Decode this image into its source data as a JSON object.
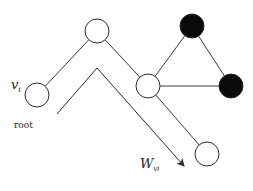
{
  "diagram": {
    "type": "graph-random-walk",
    "labels": {
      "start_node": "v",
      "start_node_sub": "i",
      "root": "root",
      "walk": "W",
      "walk_sub": "vi"
    },
    "colors": {
      "edge": "#3a3a3a",
      "node_stroke": "#2a2a2a",
      "node_fill_open": "#ffffff",
      "node_fill_filled": "#0a0a0a",
      "arrow": "#2a2a2a"
    },
    "nodes": [
      {
        "id": "root",
        "cx": 37,
        "cy": 95,
        "r": 12,
        "filled": false
      },
      {
        "id": "top",
        "cx": 97,
        "cy": 31,
        "r": 12,
        "filled": false
      },
      {
        "id": "middle",
        "cx": 148,
        "cy": 86,
        "r": 12,
        "filled": false
      },
      {
        "id": "black-top",
        "cx": 192,
        "cy": 26,
        "r": 12,
        "filled": true
      },
      {
        "id": "black-right",
        "cx": 231,
        "cy": 86,
        "r": 12,
        "filled": true
      },
      {
        "id": "bottom-right",
        "cx": 207,
        "cy": 154,
        "r": 12,
        "filled": false
      }
    ],
    "edges": [
      [
        "root",
        "top"
      ],
      [
        "top",
        "middle"
      ],
      [
        "middle",
        "black-top"
      ],
      [
        "black-top",
        "black-right"
      ],
      [
        "middle",
        "black-right"
      ],
      [
        "middle",
        "bottom-right"
      ]
    ],
    "walk_path": [
      [
        57,
        114
      ],
      [
        97,
        68
      ],
      [
        184,
        166
      ]
    ]
  }
}
